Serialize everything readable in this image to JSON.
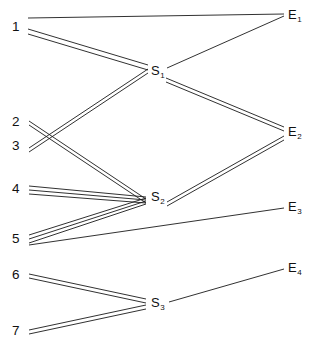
{
  "diagram": {
    "type": "network-flow-diagram",
    "width": 316,
    "height": 350,
    "background_color": "#ffffff",
    "line_color": "#1a1a1a",
    "source_nodes": [
      {
        "id": "n1",
        "label": "1",
        "x": 18,
        "y": 27
      },
      {
        "id": "n2",
        "label": "2",
        "x": 18,
        "y": 122
      },
      {
        "id": "n3",
        "label": "3",
        "x": 18,
        "y": 146
      },
      {
        "id": "n4",
        "label": "4",
        "x": 18,
        "y": 189
      },
      {
        "id": "n5",
        "label": "5",
        "x": 18,
        "y": 240
      },
      {
        "id": "n6",
        "label": "6",
        "x": 18,
        "y": 276
      },
      {
        "id": "n7",
        "label": "7",
        "x": 18,
        "y": 332
      }
    ],
    "middle_nodes": [
      {
        "id": "s1",
        "base": "S",
        "sub": "1",
        "x": 152,
        "y": 70
      },
      {
        "id": "s2",
        "base": "S",
        "sub": "2",
        "x": 152,
        "y": 196
      },
      {
        "id": "s3",
        "base": "S",
        "sub": "3",
        "x": 152,
        "y": 302
      }
    ],
    "end_nodes": [
      {
        "id": "e1",
        "base": "E",
        "sub": "1",
        "x": 291,
        "y": 17
      },
      {
        "id": "e2",
        "base": "E",
        "sub": "2",
        "x": 291,
        "y": 131
      },
      {
        "id": "e3",
        "base": "E",
        "sub": "3",
        "x": 291,
        "y": 211
      },
      {
        "id": "e4",
        "base": "E",
        "sub": "4",
        "x": 291,
        "y": 270
      }
    ],
    "edges": [
      {
        "from": "n1",
        "to": "e1",
        "multiplicity": 1,
        "name": "edge-1-to-E1"
      },
      {
        "from": "n1",
        "to": "s1",
        "multiplicity": 2,
        "name": "edge-1-to-S1"
      },
      {
        "from": "n3",
        "to": "s1",
        "multiplicity": 2,
        "name": "edge-3-to-S1"
      },
      {
        "from": "n2",
        "to": "s2",
        "multiplicity": 2,
        "name": "edge-2-to-S2"
      },
      {
        "from": "n4",
        "to": "s2",
        "multiplicity": 3,
        "name": "edge-4-to-S2"
      },
      {
        "from": "n5",
        "to": "s2",
        "multiplicity": 3,
        "name": "edge-5-to-S2"
      },
      {
        "from": "n5",
        "to": "e3",
        "multiplicity": 1,
        "name": "edge-5-to-E3"
      },
      {
        "from": "s1",
        "to": "e1",
        "multiplicity": 1,
        "name": "edge-S1-to-E1"
      },
      {
        "from": "s1",
        "to": "e2",
        "multiplicity": 2,
        "name": "edge-S1-to-E2"
      },
      {
        "from": "s2",
        "to": "e2",
        "multiplicity": 2,
        "name": "edge-S2-to-E2"
      },
      {
        "from": "n6",
        "to": "s3",
        "multiplicity": 2,
        "name": "edge-6-to-S3"
      },
      {
        "from": "n7",
        "to": "s3",
        "multiplicity": 2,
        "name": "edge-7-to-S3"
      },
      {
        "from": "s3",
        "to": "e4",
        "multiplicity": 1,
        "name": "edge-S3-to-E4"
      }
    ]
  }
}
